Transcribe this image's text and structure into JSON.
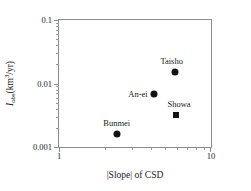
{
  "chart_data": {
    "type": "scatter",
    "title": "",
    "xlabel": "|Slope| of CSD",
    "ylabel": "I_obs (km3/yr)",
    "ylabel_parts": {
      "symbol": "I",
      "subscript": "obs",
      "units_open": " (km",
      "units_exponent": "3",
      "units_close": "/yr)"
    },
    "xscale": "log",
    "yscale": "log",
    "xlim": [
      1,
      10
    ],
    "ylim": [
      0.001,
      0.1
    ],
    "grid": false,
    "legend": "none",
    "xticks": [
      {
        "value": 1,
        "label": "1"
      },
      {
        "value": 10,
        "label": "10"
      }
    ],
    "yticks": [
      {
        "value": 0.1,
        "label": "0.1"
      },
      {
        "value": 0.01,
        "label": "0.01"
      },
      {
        "value": 0.001,
        "label": "0.001"
      }
    ],
    "points": [
      {
        "name": "Taisho",
        "label": "Taisho",
        "x": 5.8,
        "y": 0.015,
        "marker": "circle",
        "label_pos": "above-l"
      },
      {
        "name": "An-ei",
        "label": "An-ei",
        "x": 4.2,
        "y": 0.0068,
        "marker": "circle",
        "label_pos": "left"
      },
      {
        "name": "Showa",
        "label": "Showa",
        "x": 5.85,
        "y": 0.0032,
        "marker": "square",
        "label_pos": "above-r"
      },
      {
        "name": "Bunmei",
        "label": "Bunmei",
        "x": 2.4,
        "y": 0.0016,
        "marker": "circle",
        "label_pos": "above"
      }
    ]
  },
  "colors": {
    "marker": "#111111",
    "axis": "#8a8a8a",
    "text": "#1a1a1a",
    "background": "#ffffff"
  }
}
